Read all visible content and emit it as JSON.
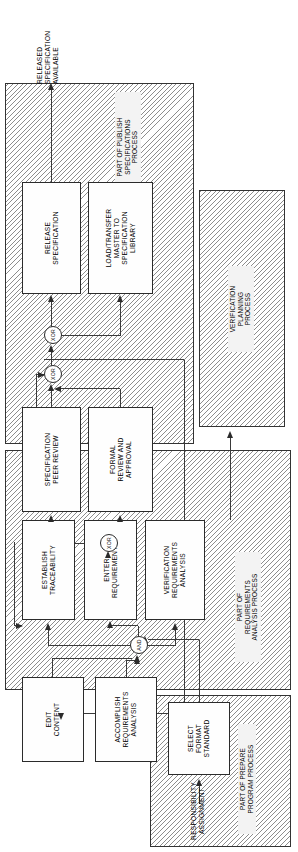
{
  "diagram": {
    "orientation": "rotated-90-ccw",
    "output_label": "RELEASED\nSPECIFICATION\nAVAILABLE",
    "input_label": "RESPONSIBILITY\nASSIGNMENT",
    "lanes": [
      {
        "id": "publish",
        "label": "PART OF PUBLISH\nSPECIFICATIONS\nPROCESS"
      },
      {
        "id": "verification",
        "label": "VERIFICATION\nPLANNING\nPROCESS"
      },
      {
        "id": "requirements",
        "label": "PART OF\nREQUIREMENTS\nANALYSIS PROCESS"
      },
      {
        "id": "prepare",
        "label": "PART OF PREPARE\nPROGRAM PROCESS"
      }
    ],
    "nodes": [
      {
        "id": "release_spec",
        "label": "RELEASE\nSPECIFICATION"
      },
      {
        "id": "load_transfer",
        "label": "LOAD/TRANSFER\nMASTER TO\nSPECIFICATION\nLIBRARY"
      },
      {
        "id": "spec_peer_review",
        "label": "SPECIFICATION\nPEER REVIEW"
      },
      {
        "id": "formal_review",
        "label": "FORMAL\nREVIEW AND\nAPPROVAL"
      },
      {
        "id": "establish_trace",
        "label": "ESTABLISH\nTRACEABILITY"
      },
      {
        "id": "enter_requirements",
        "label": "ENTER\nREQUIREMENTS"
      },
      {
        "id": "verification_req",
        "label": "VERIFICATION\nREQUIREMENTS\nANALYSIS"
      },
      {
        "id": "edit_content",
        "label": "EDIT\nCONTENT"
      },
      {
        "id": "accomplish_req",
        "label": "ACCOMPLISH\nREQUIREMENTS\nANALYSIS"
      },
      {
        "id": "select_format",
        "label": "SELECT\nFORMAT\nSTANDARD"
      }
    ],
    "gates": [
      {
        "id": "xor_top",
        "label": "XOR"
      },
      {
        "id": "xor_mid",
        "label": "XOR"
      },
      {
        "id": "xor_bottom",
        "label": "XOR"
      },
      {
        "id": "and_gate",
        "label": "AND"
      }
    ],
    "colors": {
      "stroke": "#2b2b2b",
      "hatch": "#8d8d8d",
      "node_fill": "#fefefe",
      "lane_label_fill": "#f3f3f3",
      "background": "#ffffff"
    }
  }
}
